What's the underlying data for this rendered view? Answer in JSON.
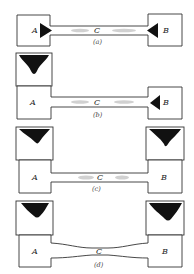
{
  "figure": {
    "panels": [
      {
        "id": "a",
        "caption": "(a)",
        "left_label": "A",
        "right_label": "B",
        "center_label": "C"
      },
      {
        "id": "b",
        "caption": "(b)",
        "left_label": "A",
        "right_label": "B",
        "center_label": "C"
      },
      {
        "id": "c",
        "caption": "(c)",
        "left_label": "A",
        "right_label": "B",
        "center_label": "C"
      },
      {
        "id": "d",
        "caption": "(d)",
        "left_label": "A",
        "right_label": "B",
        "center_label": "C"
      }
    ]
  },
  "colors": {
    "outline": "#333333",
    "fill_dark": "#111111",
    "gas": "#c9c9c9"
  }
}
